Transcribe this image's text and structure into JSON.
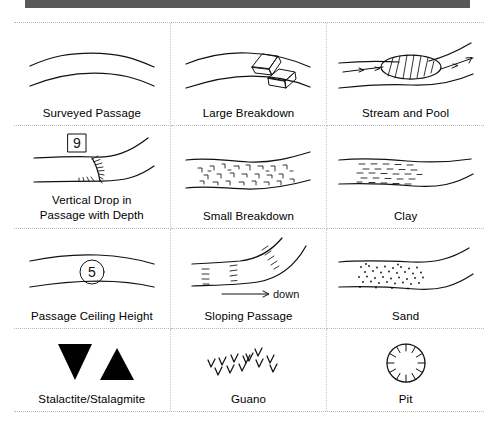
{
  "page": {
    "top_bar_color": "#595959",
    "background_color": "#ffffff",
    "separator_color": "#b9b9b9",
    "ink_color": "#111111"
  },
  "legend": {
    "columns": 3,
    "rows": 4,
    "items": [
      {
        "id": "surveyed-passage",
        "label": "Surveyed Passage",
        "symbol": "two-parallel-curved-passage-walls",
        "row": 1,
        "col": 1
      },
      {
        "id": "large-breakdown",
        "label": "Large Breakdown",
        "symbol": "two-angular-blocks-in-passage",
        "row": 1,
        "col": 2
      },
      {
        "id": "stream-and-pool",
        "label": "Stream and Pool",
        "symbol": "hatched-oval-pool-with-arrowed-stream",
        "row": 1,
        "col": 3
      },
      {
        "id": "vertical-drop-in-passage-with-depth",
        "label": "Vertical Drop in\nPassage with Depth",
        "symbol": "boxed-depth-number-with-hachured-drop",
        "depth_value": "9",
        "value_frame": "square",
        "row": 2,
        "col": 1
      },
      {
        "id": "small-breakdown",
        "label": "Small Breakdown",
        "symbol": "scattered-small-angular-rubble",
        "row": 2,
        "col": 2
      },
      {
        "id": "clay",
        "label": "Clay",
        "symbol": "short-horizontal-dash-fill",
        "row": 2,
        "col": 3
      },
      {
        "id": "passage-ceiling-height",
        "label": "Passage Ceiling Height",
        "symbol": "circled-height-number-in-passage",
        "height_value": "5",
        "value_frame": "circle",
        "row": 3,
        "col": 1
      },
      {
        "id": "sloping-passage",
        "label": "Sloping Passage",
        "symbol": "hachured-slope-with-down-arrow",
        "arrow_label": "down",
        "row": 3,
        "col": 2
      },
      {
        "id": "sand",
        "label": "Sand",
        "symbol": "stippled-dot-fill",
        "row": 3,
        "col": 3
      },
      {
        "id": "stalactite-stalagmite",
        "label": "Stalactite/Stalagmite",
        "symbol": "solid-down-triangle-and-solid-up-triangle",
        "row": 4,
        "col": 1
      },
      {
        "id": "guano",
        "label": "Guano",
        "symbol": "scattered-v-marks",
        "row": 4,
        "col": 2
      },
      {
        "id": "pit",
        "label": "Pit",
        "symbol": "circle-with-inward-hachure-ticks",
        "row": 4,
        "col": 3
      }
    ]
  }
}
